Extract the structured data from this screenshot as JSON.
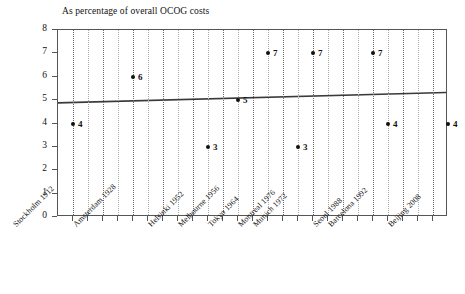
{
  "chart_data": {
    "type": "scatter",
    "title": "As percentage of overall OCOG costs",
    "xlabel": "",
    "ylabel": "",
    "ylim": [
      0,
      8
    ],
    "ytick_labels": [
      "8",
      "7",
      "6",
      "5",
      "4",
      "3",
      "2",
      "1",
      "0"
    ],
    "ytick_values": [
      8,
      7,
      6,
      5,
      4,
      3,
      2,
      1,
      0
    ],
    "grid": true,
    "grid_axis": "x",
    "legend": "none",
    "categories": [
      "Stockholm 1912",
      "Amsterdam 1928",
      "Helsinki 1952",
      "Melbourne 1956",
      "Tokyo 1964",
      "Munich 1972",
      "Montreal 1976",
      "Seoul 1988",
      "Barcelona 1992",
      "Beijing 2008"
    ],
    "points": [
      {
        "label": "Stockholm 1912",
        "slot": 0,
        "value": 4,
        "data_label": "4"
      },
      {
        "label": "Amsterdam 1928",
        "slot": 4,
        "value": 6,
        "data_label": "6"
      },
      {
        "label": "Helsinki 1952",
        "slot": 9,
        "value": 3,
        "data_label": "3"
      },
      {
        "label": "Melbourne 1956",
        "slot": 11,
        "value": 5,
        "data_label": "5"
      },
      {
        "label": "Tokyo 1964",
        "slot": 13,
        "value": 7,
        "data_label": "7"
      },
      {
        "label": "Munich 1972",
        "slot": 16,
        "value": 7,
        "data_label": "7"
      },
      {
        "label": "Montreal 1976",
        "slot": 15,
        "value": 3,
        "data_label": "3"
      },
      {
        "label": "Seoul 1988",
        "slot": 20,
        "value": 7,
        "data_label": "7"
      },
      {
        "label": "Barcelona 1992",
        "slot": 21,
        "value": 4,
        "data_label": "4"
      },
      {
        "label": "Beijing 2008",
        "slot": 25,
        "value": 4,
        "data_label": "4"
      }
    ],
    "trendline": {
      "type": "linear",
      "start_value": 4.85,
      "end_value": 5.3,
      "color": "#3a3a3a"
    },
    "grid_slots": 25,
    "colors": {
      "marker": "#111111",
      "axis": "#555555",
      "grid": "#6b6b6b",
      "grid_faint": "#a9a9a9",
      "text": "#111111",
      "background": "#ffffff"
    }
  },
  "labels": {
    "y_axis_title": "",
    "x_axis_title": ""
  }
}
